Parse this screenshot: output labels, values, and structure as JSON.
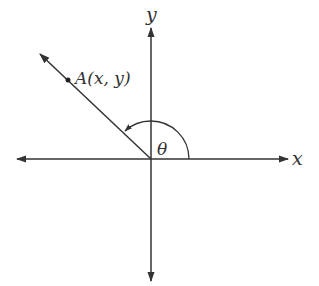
{
  "diagram": {
    "type": "angle-in-standard-position",
    "axes": {
      "x_label": "x",
      "y_label": "y"
    },
    "point": {
      "label": "A(x, y)"
    },
    "angle": {
      "label": "θ"
    },
    "colors": {
      "stroke": "#333333",
      "background": "#ffffff"
    }
  }
}
